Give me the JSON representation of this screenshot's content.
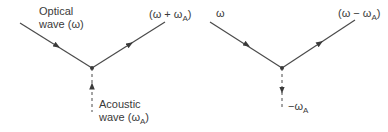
{
  "colors": {
    "line": "#4a4a4a",
    "text": "#3a3a3a",
    "background": "#ffffff"
  },
  "left_diagram": {
    "incoming_label_line1": "Optical",
    "incoming_label_line2": "wave (ω)",
    "outgoing_label_main": "(ω + ω",
    "outgoing_label_sub": "A",
    "outgoing_label_close": ")",
    "acoustic_label_line1": "Acoustic",
    "acoustic_label_line2_main": "wave (ω",
    "acoustic_label_line2_sub": "A",
    "acoustic_label_line2_close": ")",
    "acoustic_direction": "up"
  },
  "right_diagram": {
    "incoming_label": "ω",
    "outgoing_label_main": "(ω − ω",
    "outgoing_label_sub": "A",
    "outgoing_label_close": ")",
    "acoustic_label_main": "−ω",
    "acoustic_label_sub": "A",
    "acoustic_direction": "down"
  }
}
